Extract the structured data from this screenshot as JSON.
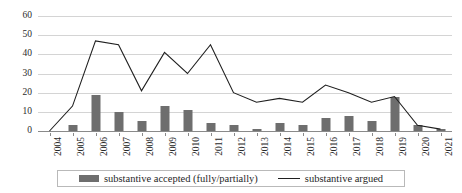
{
  "chart_data": {
    "type": "bar",
    "title": "",
    "subtitle": "",
    "xlabel": "",
    "ylabel": "",
    "ylim": [
      0,
      60
    ],
    "yticks": [
      0,
      10,
      20,
      30,
      40,
      50,
      60
    ],
    "grid": true,
    "legend_position": "bottom",
    "categories": [
      "2004",
      "2005",
      "2006",
      "2007",
      "2008",
      "2009",
      "2010",
      "2011",
      "2012",
      "2013",
      "2014",
      "2015",
      "2016",
      "2017",
      "2018",
      "2019",
      "2020",
      "2021"
    ],
    "series": [
      {
        "name": "substantive accepted (fully/partially)",
        "type": "bar",
        "color": "#6e6e6e",
        "values": [
          0,
          3,
          19,
          10,
          5,
          13,
          11,
          4,
          3,
          1,
          4,
          3,
          7,
          8,
          5,
          18,
          3,
          1
        ]
      },
      {
        "name": "substantive argued",
        "type": "line",
        "color": "#1f1f1f",
        "values": [
          0,
          13,
          47,
          45,
          21,
          41,
          30,
          45,
          20,
          15,
          17,
          15,
          24,
          20,
          15,
          18,
          3,
          1
        ]
      }
    ]
  },
  "legend": {
    "entries": [
      {
        "label": "substantive accepted (fully/partially)",
        "marker": "bar-swatch-icon"
      },
      {
        "label": "substantive argued",
        "marker": "line-swatch-icon"
      }
    ]
  }
}
